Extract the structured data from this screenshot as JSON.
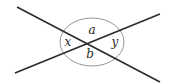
{
  "diagram": {
    "type": "intersecting-lines-angles",
    "colors": {
      "line": "#2b2b2b",
      "circle": "#8a8a8a",
      "text": "#2a2a2a",
      "background": "#ffffff"
    },
    "lines": [
      {
        "id": "line-1",
        "from": [
          17,
          7
        ],
        "to": [
          160,
          82
        ]
      },
      {
        "id": "line-2",
        "from": [
          15,
          73
        ],
        "to": [
          160,
          14
        ]
      }
    ],
    "intersection": [
      92,
      42
    ],
    "circle": {
      "cx": 92,
      "cy": 42,
      "rx": 32,
      "ry": 24
    },
    "angles": [
      {
        "label": "a",
        "position": "top",
        "x": 92,
        "y": 34
      },
      {
        "label": "b",
        "position": "bottom",
        "x": 90,
        "y": 57
      },
      {
        "label": "x",
        "position": "left",
        "x": 68,
        "y": 46
      },
      {
        "label": "y",
        "position": "right",
        "x": 115,
        "y": 46
      }
    ]
  }
}
